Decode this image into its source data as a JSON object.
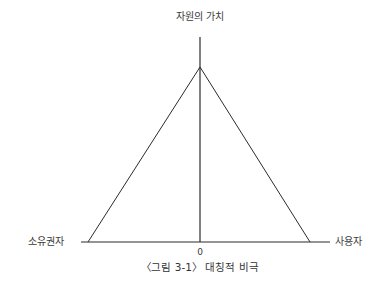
{
  "figure": {
    "caption": "〈그림 3-1〉 대칭적 비극",
    "labels": {
      "vertical_axis": "자원의 가치",
      "left_end": "소유권자",
      "right_end": "사용자",
      "origin": "0"
    },
    "geometry": {
      "baseline": {
        "x1": 81,
        "x2": 330,
        "y": 242
      },
      "vertical_axis": {
        "x": 200,
        "y1": 37,
        "y2": 242
      },
      "triangle": {
        "apex": [
          200,
          67
        ],
        "left_foot": [
          88,
          242
        ],
        "right_foot": [
          310,
          242
        ]
      }
    },
    "colors": {
      "line": "#2b2b2b",
      "text": "#3a3a3a",
      "background": "#ffffff"
    }
  }
}
